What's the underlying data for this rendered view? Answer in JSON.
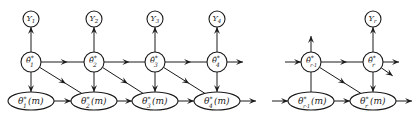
{
  "diagram": {
    "type": "state-space dependency graph",
    "nodes": {
      "observations": [
        {
          "id": "Y1",
          "base": "Y",
          "sub": "1"
        },
        {
          "id": "Y2",
          "base": "Y",
          "sub": "2"
        },
        {
          "id": "Y3",
          "base": "Y",
          "sub": "3"
        },
        {
          "id": "Y4",
          "base": "Y",
          "sub": "4"
        },
        {
          "id": "Yr",
          "base": "Y",
          "sub": "r"
        }
      ],
      "estimates": [
        {
          "id": "th1",
          "base": "θ̂",
          "sup": "*",
          "sub": "1"
        },
        {
          "id": "th2",
          "base": "θ̂",
          "sup": "*",
          "sub": "2"
        },
        {
          "id": "th3",
          "base": "θ̂",
          "sup": "*",
          "sub": "3"
        },
        {
          "id": "th4",
          "base": "θ̂",
          "sup": "*",
          "sub": "4"
        },
        {
          "id": "thr1",
          "base": "θ̂",
          "sup": "*",
          "sub": "r-1"
        },
        {
          "id": "thr",
          "base": "θ̂",
          "sup": "*",
          "sub": "r"
        }
      ],
      "states": [
        {
          "id": "m1",
          "base": "θ",
          "sup": "*",
          "sub": "1",
          "arg": "(m)"
        },
        {
          "id": "m2",
          "base": "θ",
          "sup": "*",
          "sub": "2",
          "arg": "(m)"
        },
        {
          "id": "m3",
          "base": "θ",
          "sup": "*",
          "sub": "3",
          "arg": "(m)"
        },
        {
          "id": "m4",
          "base": "θ",
          "sup": "*",
          "sub": "4",
          "arg": "(m)"
        },
        {
          "id": "mr1",
          "base": "θ",
          "sup": "*",
          "sub": "r-1",
          "arg": "(m)"
        },
        {
          "id": "mr",
          "base": "θ",
          "sup": "*",
          "sub": "r",
          "arg": "(m)"
        }
      ]
    },
    "edges": [
      {
        "from": "th1",
        "to": "Y1"
      },
      {
        "from": "th2",
        "to": "Y2"
      },
      {
        "from": "th3",
        "to": "Y3"
      },
      {
        "from": "th4",
        "to": "Y4"
      },
      {
        "from": "thr",
        "to": "Yr"
      },
      {
        "from": "thr1",
        "to": "up"
      },
      {
        "from": "th1",
        "to": "th2"
      },
      {
        "from": "th2",
        "to": "th3"
      },
      {
        "from": "th3",
        "to": "th4"
      },
      {
        "from": "th4",
        "to": "right"
      },
      {
        "from": "left",
        "to": "thr1"
      },
      {
        "from": "thr1",
        "to": "thr"
      },
      {
        "from": "thr",
        "to": "right"
      },
      {
        "from": "thr",
        "to": "lower-right"
      },
      {
        "from": "th1",
        "to": "m1"
      },
      {
        "from": "th2",
        "to": "m2"
      },
      {
        "from": "th3",
        "to": "m3"
      },
      {
        "from": "th4",
        "to": "m4"
      },
      {
        "from": "thr",
        "to": "mr"
      },
      {
        "from": "thr1",
        "to": "mr1",
        "arrow": false
      },
      {
        "from": "th1",
        "to": "m2"
      },
      {
        "from": "th2",
        "to": "m3"
      },
      {
        "from": "th3",
        "to": "m4"
      },
      {
        "from": "thr1",
        "to": "mr"
      },
      {
        "from": "m1",
        "to": "m2"
      },
      {
        "from": "m2",
        "to": "m3"
      },
      {
        "from": "m3",
        "to": "m4"
      },
      {
        "from": "m4",
        "to": "right"
      },
      {
        "from": "left",
        "to": "mr1"
      },
      {
        "from": "mr1",
        "to": "mr"
      },
      {
        "from": "mr",
        "to": "right"
      }
    ]
  }
}
